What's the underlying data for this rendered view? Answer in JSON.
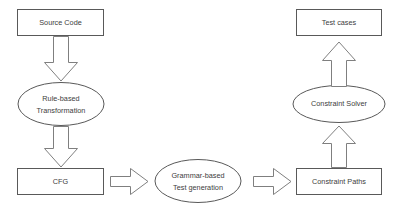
{
  "diagram": {
    "background_color": "#ffffff",
    "shape_stroke_color": "#595959",
    "arrow_stroke_color": "#7f7f7f",
    "shape_fill_color": "#ffffff",
    "text_color": "#404040",
    "nodes": [
      {
        "id": "source-code",
        "shape": "rectangle",
        "label": "Source Code",
        "x": 17,
        "y": 9,
        "w": 87,
        "h": 27
      },
      {
        "id": "rule-based-transformation",
        "shape": "ellipse",
        "label_line1": "Rule-based",
        "label_line2": "Transformation",
        "cx": 61,
        "cy": 104,
        "rx": 43,
        "ry": 21
      },
      {
        "id": "cfg",
        "shape": "rectangle",
        "label": "CFG",
        "x": 17,
        "y": 168,
        "w": 87,
        "h": 27
      },
      {
        "id": "grammar-based-test-generation",
        "shape": "ellipse",
        "label_line1": "Grammar-based",
        "label_line2": "Test generation",
        "cx": 198,
        "cy": 181,
        "rx": 43,
        "ry": 21
      },
      {
        "id": "constraint-paths",
        "shape": "rectangle",
        "label": "Constraint Paths",
        "x": 296,
        "y": 168,
        "w": 86,
        "h": 27
      },
      {
        "id": "constraint-solver",
        "shape": "ellipse",
        "label": "Constraint Solver",
        "cx": 339,
        "cy": 104,
        "rx": 46,
        "ry": 19
      },
      {
        "id": "test-cases",
        "shape": "rectangle",
        "label": "Test cases",
        "x": 296,
        "y": 9,
        "w": 86,
        "h": 27
      }
    ],
    "arrows": [
      {
        "id": "source-code-to-rule-based",
        "direction": "down",
        "from": "source-code",
        "to": "rule-based-transformation"
      },
      {
        "id": "rule-based-to-cfg",
        "direction": "down",
        "from": "rule-based-transformation",
        "to": "cfg"
      },
      {
        "id": "cfg-to-grammar-based",
        "direction": "right",
        "from": "cfg",
        "to": "grammar-based-test-generation"
      },
      {
        "id": "grammar-based-to-constraint-paths",
        "direction": "right",
        "from": "grammar-based-test-generation",
        "to": "constraint-paths"
      },
      {
        "id": "constraint-paths-to-constraint-solver",
        "direction": "up",
        "from": "constraint-paths",
        "to": "constraint-solver"
      },
      {
        "id": "constraint-solver-to-test-cases",
        "direction": "up",
        "from": "constraint-solver",
        "to": "test-cases"
      }
    ]
  }
}
